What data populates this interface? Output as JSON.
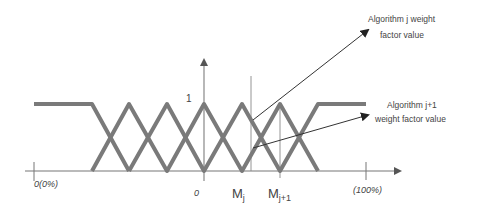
{
  "diagram": {
    "type": "fuzzy-membership-functions",
    "colors": {
      "membership_line": "#7a7a7a",
      "axis": "#777777",
      "annotation": "#333333",
      "text": "#444444",
      "background": "#ffffff"
    },
    "y_axis": {
      "top_label": "1"
    },
    "x_axis": {
      "left_label": "0(0%)",
      "origin_label": "0",
      "mj_label_base": "M",
      "mj_label_sub": "j",
      "mj1_label_base": "M",
      "mj1_label_sub": "j+1",
      "right_label": "(100%)"
    },
    "annotations": [
      {
        "line1": "Algorithm j weight",
        "line2": "factor value"
      },
      {
        "line1": "Algorithm j+1",
        "line2": "weight factor value"
      }
    ]
  }
}
